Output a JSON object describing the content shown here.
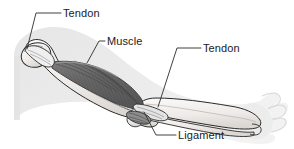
{
  "figure": {
    "width": 294,
    "height": 149,
    "background_color": "#ffffff"
  },
  "labels": [
    {
      "id": "tendon-upper",
      "text": "Tendon",
      "x": 63,
      "y": 7,
      "points_to": "proximal biceps tendon at shoulder"
    },
    {
      "id": "muscle",
      "text": "Muscle",
      "x": 107,
      "y": 35,
      "points_to": "biceps brachii muscle belly"
    },
    {
      "id": "tendon-lower",
      "text": "Tendon",
      "x": 203,
      "y": 42,
      "points_to": "distal biceps tendon at elbow"
    },
    {
      "id": "ligament",
      "text": "Ligament",
      "x": 178,
      "y": 129,
      "points_to": "elbow ligament"
    }
  ],
  "leader_lines": [
    {
      "id": "leader-tendon-upper",
      "path": "M 61 13 L 36 13 L 27 49"
    },
    {
      "id": "leader-muscle",
      "path": "M 105 41 L 99 41 L 87 63"
    },
    {
      "id": "leader-tendon-lower",
      "path": "M 201 48 L 177 48 L 158 107"
    },
    {
      "id": "leader-ligament",
      "path": "M 176 135 L 156 135 L 144 112"
    }
  ],
  "colors": {
    "outline": "#1a1a1a",
    "leader_line": "#3a3a3a",
    "label_text": "#1a1a1a",
    "skin_silhouette": "#e2e2e2",
    "skin_silhouette_light": "#ededed",
    "bone_fill": "#f2f0ee",
    "bone_shade": "#d8d5d2",
    "muscle_dark": "#5a5a5a",
    "muscle_mid": "#7a7a7a",
    "muscle_light": "#9b9b9b",
    "tendon_fill": "#efefef",
    "ligament_fill": "#8d8d8d"
  },
  "structures": [
    {
      "name": "arm-silhouette",
      "kind": "skin outline of upper arm, forearm and hand"
    },
    {
      "name": "humerus",
      "kind": "upper arm bone"
    },
    {
      "name": "radius-ulna",
      "kind": "forearm bones"
    },
    {
      "name": "biceps-muscle",
      "kind": "striated muscle belly"
    },
    {
      "name": "proximal-tendon",
      "kind": "tendon at shoulder end"
    },
    {
      "name": "distal-tendon",
      "kind": "tendon at elbow end"
    },
    {
      "name": "elbow-ligament",
      "kind": "ligament across elbow joint"
    },
    {
      "name": "hand-fingers",
      "kind": "hand with fingers"
    }
  ]
}
